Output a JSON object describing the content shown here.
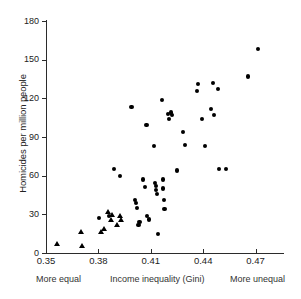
{
  "chart_data": {
    "type": "scatter",
    "title": "",
    "xlabel": "Income inequality (Gini)",
    "ylabel": "Homicides per million people",
    "xlim": [
      0.35,
      0.4857
    ],
    "ylim": [
      0,
      180
    ],
    "xticks": [
      "0.35",
      "0.38",
      "0.41",
      "0.44",
      "0.47"
    ],
    "xtick_values": [
      0.35,
      0.38,
      0.41,
      0.44,
      0.47
    ],
    "yticks": [
      "0",
      "30",
      "60",
      "90",
      "120",
      "150",
      "180"
    ],
    "ytick_values": [
      0,
      30,
      60,
      90,
      120,
      150,
      180
    ],
    "grid": false,
    "legend": "none",
    "annotations": {
      "left": "More equal",
      "center": "Income inequality (Gini)",
      "right": "More unequal"
    },
    "series": [
      {
        "name": "low-inequality states",
        "marker": "triangle",
        "points": [
          {
            "x": 0.3565,
            "y": 7
          },
          {
            "x": 0.37,
            "y": 17
          },
          {
            "x": 0.3705,
            "y": 6
          },
          {
            "x": 0.3815,
            "y": 17
          },
          {
            "x": 0.383,
            "y": 19
          },
          {
            "x": 0.3855,
            "y": 32
          },
          {
            "x": 0.3875,
            "y": 26
          },
          {
            "x": 0.388,
            "y": 30
          },
          {
            "x": 0.3905,
            "y": 22
          },
          {
            "x": 0.3925,
            "y": 29
          },
          {
            "x": 0.393,
            "y": 26
          }
        ]
      },
      {
        "name": "higher-inequality states",
        "marker": "circle",
        "points": [
          {
            "x": 0.3805,
            "y": 27
          },
          {
            "x": 0.386,
            "y": 29
          },
          {
            "x": 0.389,
            "y": 65
          },
          {
            "x": 0.3925,
            "y": 60
          },
          {
            "x": 0.399,
            "y": 113
          },
          {
            "x": 0.401,
            "y": 41
          },
          {
            "x": 0.4015,
            "y": 39
          },
          {
            "x": 0.402,
            "y": 35
          },
          {
            "x": 0.403,
            "y": 22
          },
          {
            "x": 0.4035,
            "y": 24
          },
          {
            "x": 0.4055,
            "y": 57
          },
          {
            "x": 0.4065,
            "y": 51
          },
          {
            "x": 0.4075,
            "y": 99
          },
          {
            "x": 0.408,
            "y": 29
          },
          {
            "x": 0.409,
            "y": 26
          },
          {
            "x": 0.412,
            "y": 83
          },
          {
            "x": 0.4125,
            "y": 54
          },
          {
            "x": 0.413,
            "y": 52
          },
          {
            "x": 0.4132,
            "y": 49
          },
          {
            "x": 0.4135,
            "y": 46
          },
          {
            "x": 0.414,
            "y": 15
          },
          {
            "x": 0.4165,
            "y": 119
          },
          {
            "x": 0.417,
            "y": 57
          },
          {
            "x": 0.4172,
            "y": 50
          },
          {
            "x": 0.4175,
            "y": 41
          },
          {
            "x": 0.4178,
            "y": 34
          },
          {
            "x": 0.42,
            "y": 108
          },
          {
            "x": 0.4205,
            "y": 104
          },
          {
            "x": 0.4215,
            "y": 109
          },
          {
            "x": 0.422,
            "y": 107
          },
          {
            "x": 0.425,
            "y": 64
          },
          {
            "x": 0.4285,
            "y": 94
          },
          {
            "x": 0.4295,
            "y": 84
          },
          {
            "x": 0.4365,
            "y": 126
          },
          {
            "x": 0.437,
            "y": 131
          },
          {
            "x": 0.4395,
            "y": 104
          },
          {
            "x": 0.441,
            "y": 83
          },
          {
            "x": 0.4445,
            "y": 112
          },
          {
            "x": 0.4455,
            "y": 132
          },
          {
            "x": 0.446,
            "y": 107
          },
          {
            "x": 0.4485,
            "y": 127
          },
          {
            "x": 0.449,
            "y": 65
          },
          {
            "x": 0.453,
            "y": 65
          },
          {
            "x": 0.4655,
            "y": 137
          },
          {
            "x": 0.4715,
            "y": 158
          }
        ]
      }
    ]
  },
  "axis": {
    "y_title": "Homicides per million people"
  }
}
